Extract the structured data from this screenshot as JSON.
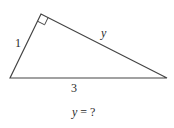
{
  "diagram": {
    "type": "right-triangle",
    "vertices": {
      "bottom_left": [
        10,
        78
      ],
      "top_right_angle": [
        41,
        14
      ],
      "bottom_right": [
        167,
        78
      ]
    },
    "right_angle_at": "top_right_angle",
    "stroke_color": "#444444",
    "labels": {
      "left_leg": "1",
      "upper_leg": "y",
      "base": "3"
    },
    "question": {
      "variable": "y",
      "rest": " = ?"
    }
  }
}
